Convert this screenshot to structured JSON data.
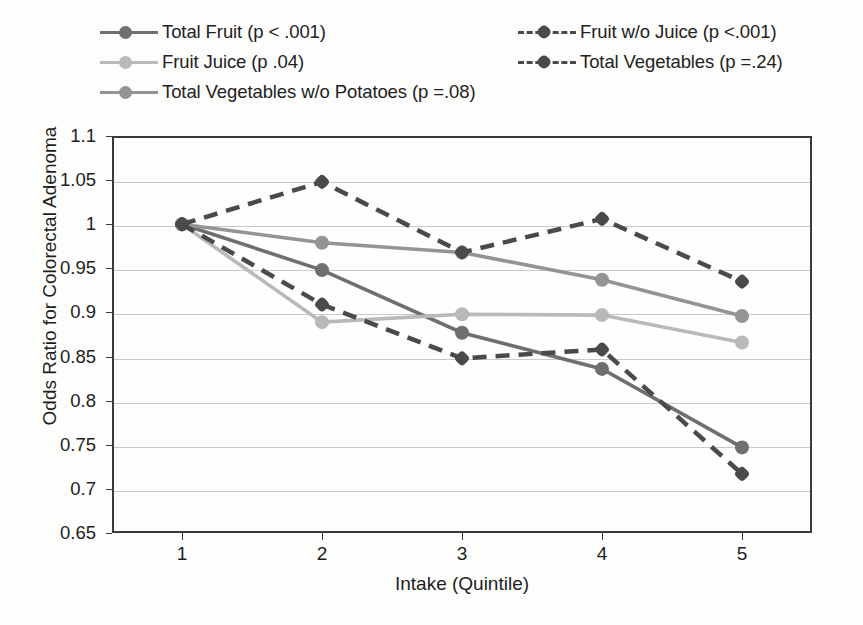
{
  "chart_data": {
    "type": "line",
    "title": "",
    "xlabel": "Intake (Quintile)",
    "ylabel": "Odds Ratio for Colorectal Adenoma",
    "x": [
      1,
      2,
      3,
      4,
      5
    ],
    "xtick_labels": [
      "1",
      "2",
      "3",
      "4",
      "5"
    ],
    "ytick_labels": [
      "1.1",
      "1.05",
      "1",
      "0.95",
      "0.9",
      "0.85",
      "0.8",
      "0.75",
      "0.7",
      "0.65"
    ],
    "ytick_values": [
      1.1,
      1.05,
      1.0,
      0.95,
      0.9,
      0.85,
      0.8,
      0.75,
      0.7,
      0.65
    ],
    "ylim": [
      0.65,
      1.1
    ],
    "xlim": [
      0.5,
      5.5
    ],
    "grid": true,
    "legend_position": "top",
    "series": [
      {
        "name": "Total Fruit (p < .001)",
        "values": [
          1.0,
          0.948,
          0.877,
          0.836,
          0.747
        ],
        "color": "#6f6f6f",
        "style": "solid",
        "marker": "circle"
      },
      {
        "name": "Fruit Juice (p .04)",
        "values": [
          1.0,
          0.889,
          0.898,
          0.897,
          0.866
        ],
        "color": "#b9b9b9",
        "style": "solid",
        "marker": "circle"
      },
      {
        "name": "Total Vegetables w/o Potatoes (p =.08)",
        "values": [
          1.0,
          0.979,
          0.968,
          0.937,
          0.896
        ],
        "color": "#949494",
        "style": "solid",
        "marker": "circle"
      },
      {
        "name": "Fruit w/o Juice (p <.001)",
        "values": [
          1.0,
          0.909,
          0.848,
          0.858,
          0.717
        ],
        "color": "#4a4a4a",
        "style": "dashed",
        "marker": "diamond"
      },
      {
        "name": "Total Vegetables (p =.24)",
        "values": [
          1.0,
          1.048,
          0.968,
          1.006,
          0.935
        ],
        "color": "#4a4a4a",
        "style": "dashed",
        "marker": "diamond"
      }
    ]
  },
  "legend": {
    "entries": [
      {
        "label": "Total Fruit (p < .001)",
        "column": "left",
        "row": 0,
        "color": "#6f6f6f",
        "style": "solid",
        "marker": "circle"
      },
      {
        "label": "Fruit Juice (p .04)",
        "column": "left",
        "row": 1,
        "color": "#b9b9b9",
        "style": "solid",
        "marker": "circle"
      },
      {
        "label": "Total Vegetables w/o Potatoes (p =.08)",
        "column": "left",
        "row": 2,
        "color": "#949494",
        "style": "solid",
        "marker": "circle"
      },
      {
        "label": "Fruit w/o Juice (p <.001)",
        "column": "right",
        "row": 0,
        "color": "#4a4a4a",
        "style": "dashed",
        "marker": "diamond"
      },
      {
        "label": "Total Vegetables (p =.24)",
        "column": "right",
        "row": 1,
        "color": "#4a4a4a",
        "style": "dashed",
        "marker": "diamond"
      }
    ]
  },
  "colors": {
    "axis": "#3a3a3a",
    "grid": "#c9c9c9",
    "background": "#fdfdfc",
    "text": "#1d1d1d"
  }
}
